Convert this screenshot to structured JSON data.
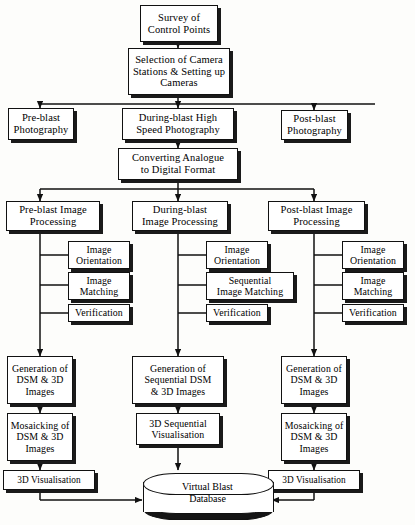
{
  "diagram": {
    "line_color": "#111111",
    "box_fill": "#ffffff",
    "shadow_color": "#1a1a1a"
  },
  "nodes": {
    "survey": "Survey of\nControl Points",
    "selection": "Selection of Camera\nStations & Setting up\nCameras",
    "pre_photo": "Pre-blast\nPhotography",
    "during_photo": "During-blast High\nSpeed Photography",
    "post_photo": "Post-blast\nPhotography",
    "converting": "Converting Analogue\nto Digital Format",
    "pre_proc": "Pre-blast Image\nProcessing",
    "during_proc": "During-blast\nImage Processing",
    "post_proc": "Post-blast Image\nProcessing",
    "pre_orient": "Image\nOrientation",
    "pre_match": "Image\nMatching",
    "pre_verify": "Verification",
    "dur_orient": "Image\nOrientation",
    "dur_match": "Sequential\nImage Matching",
    "dur_verify": "Verification",
    "post_orient": "Image\nOrientation",
    "post_match": "Image\nMatching",
    "post_verify": "Verification",
    "pre_gen": "Generation of\nDSM & 3D\nImages",
    "dur_gen": "Generation of\nSequential DSM\n& 3D Images",
    "post_gen": "Generation of\nDSM & 3D\nImages",
    "pre_mosaic": "Mosaicking of\nDSM & 3D\nImages",
    "dur_vis": "3D Sequential\nVisualisation",
    "post_mosaic": "Mosaicking of\nDSM & 3D\nImages",
    "pre_3dvis": "3D Visualisation",
    "post_3dvis": "3D Visualisation",
    "database": "Virtual Blast\nDatabase"
  }
}
